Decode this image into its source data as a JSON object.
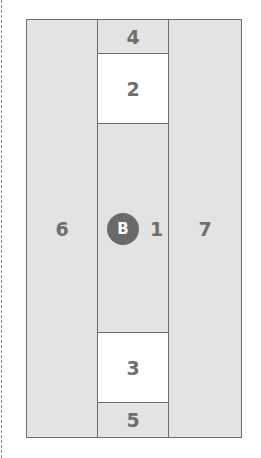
{
  "diagram": {
    "regions": {
      "r1": {
        "label": "1"
      },
      "r2": {
        "label": "2"
      },
      "r3": {
        "label": "3"
      },
      "r4": {
        "label": "4"
      },
      "r5": {
        "label": "5"
      },
      "r6": {
        "label": "6"
      },
      "r7": {
        "label": "7"
      }
    },
    "marker": {
      "label": "B"
    },
    "colors": {
      "fill_gray": "#e3e3e3",
      "fill_white": "#ffffff",
      "border": "#6e6e6e",
      "text": "#6f6f6f",
      "marker_bg": "#6a6a6a"
    }
  }
}
